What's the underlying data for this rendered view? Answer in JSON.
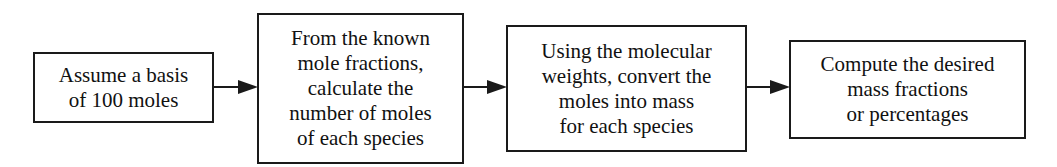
{
  "diagram": {
    "type": "flowchart",
    "direction": "left-to-right",
    "steps": [
      {
        "id": "step1",
        "text": "Assume a basis\nof 100 moles"
      },
      {
        "id": "step2",
        "text": "From the known\nmole fractions,\ncalculate the\nnumber of moles\nof each species"
      },
      {
        "id": "step3",
        "text": "Using the molecular\nweights, convert the\nmoles into mass\nfor each species"
      },
      {
        "id": "step4",
        "text": "Compute the desired\nmass fractions\nor percentages"
      }
    ],
    "edges": [
      {
        "from": "step1",
        "to": "step2"
      },
      {
        "from": "step2",
        "to": "step3"
      },
      {
        "from": "step3",
        "to": "step4"
      }
    ],
    "colors": {
      "stroke": "#1a1a1a",
      "background": "#ffffff",
      "text": "#111111"
    }
  }
}
